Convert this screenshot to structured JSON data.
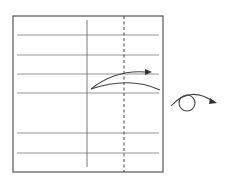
{
  "diagram": {
    "type": "folding-instruction",
    "colors": {
      "stroke": "#555555",
      "paper": "#ffffff"
    },
    "paper": {
      "x": 13,
      "y": 16,
      "width": 150,
      "height": 156
    },
    "horizontal_lines_y": [
      35,
      55,
      74,
      93,
      133,
      153
    ],
    "vertical_line": {
      "x": 87,
      "y1": 20,
      "y2": 167,
      "style": "solid"
    },
    "fold_line": {
      "x": 124,
      "y1": 16,
      "y2": 172,
      "style": "dashed",
      "label": "valley fold"
    },
    "fold_arrow": {
      "label": "fold direction arrow"
    },
    "turn_over_symbol": {
      "label": "turn over"
    }
  }
}
